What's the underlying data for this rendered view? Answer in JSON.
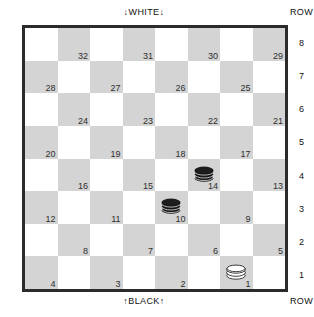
{
  "board": {
    "top_label": "↓WHITE↓",
    "bottom_label": "↑BLACK↑",
    "row_caption_top": "ROW",
    "row_caption_bottom": "ROW",
    "row_numbers": [
      "8",
      "7",
      "6",
      "5",
      "4",
      "3",
      "2",
      "1"
    ],
    "colors": {
      "light_square": "#ffffff",
      "dark_square": "#d4d4d4",
      "border": "#2b2b2b",
      "black_piece": "#1a1a1a",
      "white_piece": "#ffffff",
      "square_number_text": "#2e2e2e"
    },
    "squares": [
      {
        "row": 8,
        "col": 1,
        "shade": "light",
        "number": null,
        "piece": null
      },
      {
        "row": 8,
        "col": 2,
        "shade": "dark",
        "number": "32",
        "piece": null
      },
      {
        "row": 8,
        "col": 3,
        "shade": "light",
        "number": null,
        "piece": null
      },
      {
        "row": 8,
        "col": 4,
        "shade": "dark",
        "number": "31",
        "piece": null
      },
      {
        "row": 8,
        "col": 5,
        "shade": "light",
        "number": null,
        "piece": null
      },
      {
        "row": 8,
        "col": 6,
        "shade": "dark",
        "number": "30",
        "piece": null
      },
      {
        "row": 8,
        "col": 7,
        "shade": "light",
        "number": null,
        "piece": null
      },
      {
        "row": 8,
        "col": 8,
        "shade": "dark",
        "number": "29",
        "piece": null
      },
      {
        "row": 7,
        "col": 1,
        "shade": "dark",
        "number": "28",
        "piece": null
      },
      {
        "row": 7,
        "col": 2,
        "shade": "light",
        "number": null,
        "piece": null
      },
      {
        "row": 7,
        "col": 3,
        "shade": "dark",
        "number": "27",
        "piece": null
      },
      {
        "row": 7,
        "col": 4,
        "shade": "light",
        "number": null,
        "piece": null
      },
      {
        "row": 7,
        "col": 5,
        "shade": "dark",
        "number": "26",
        "piece": null
      },
      {
        "row": 7,
        "col": 6,
        "shade": "light",
        "number": null,
        "piece": null
      },
      {
        "row": 7,
        "col": 7,
        "shade": "dark",
        "number": "25",
        "piece": null
      },
      {
        "row": 7,
        "col": 8,
        "shade": "light",
        "number": null,
        "piece": null
      },
      {
        "row": 6,
        "col": 1,
        "shade": "light",
        "number": null,
        "piece": null
      },
      {
        "row": 6,
        "col": 2,
        "shade": "dark",
        "number": "24",
        "piece": null
      },
      {
        "row": 6,
        "col": 3,
        "shade": "light",
        "number": null,
        "piece": null
      },
      {
        "row": 6,
        "col": 4,
        "shade": "dark",
        "number": "23",
        "piece": null
      },
      {
        "row": 6,
        "col": 5,
        "shade": "light",
        "number": null,
        "piece": null
      },
      {
        "row": 6,
        "col": 6,
        "shade": "dark",
        "number": "22",
        "piece": null
      },
      {
        "row": 6,
        "col": 7,
        "shade": "light",
        "number": null,
        "piece": null
      },
      {
        "row": 6,
        "col": 8,
        "shade": "dark",
        "number": "21",
        "piece": null
      },
      {
        "row": 5,
        "col": 1,
        "shade": "dark",
        "number": "20",
        "piece": null
      },
      {
        "row": 5,
        "col": 2,
        "shade": "light",
        "number": null,
        "piece": null
      },
      {
        "row": 5,
        "col": 3,
        "shade": "dark",
        "number": "19",
        "piece": null
      },
      {
        "row": 5,
        "col": 4,
        "shade": "light",
        "number": null,
        "piece": null
      },
      {
        "row": 5,
        "col": 5,
        "shade": "dark",
        "number": "18",
        "piece": null
      },
      {
        "row": 5,
        "col": 6,
        "shade": "light",
        "number": null,
        "piece": null
      },
      {
        "row": 5,
        "col": 7,
        "shade": "dark",
        "number": "17",
        "piece": null
      },
      {
        "row": 5,
        "col": 8,
        "shade": "light",
        "number": null,
        "piece": null
      },
      {
        "row": 4,
        "col": 1,
        "shade": "light",
        "number": null,
        "piece": null
      },
      {
        "row": 4,
        "col": 2,
        "shade": "dark",
        "number": "16",
        "piece": null
      },
      {
        "row": 4,
        "col": 3,
        "shade": "light",
        "number": null,
        "piece": null
      },
      {
        "row": 4,
        "col": 4,
        "shade": "dark",
        "number": "15",
        "piece": null
      },
      {
        "row": 4,
        "col": 5,
        "shade": "light",
        "number": null,
        "piece": null
      },
      {
        "row": 4,
        "col": 6,
        "shade": "dark",
        "number": "14",
        "piece": "black-king"
      },
      {
        "row": 4,
        "col": 7,
        "shade": "light",
        "number": null,
        "piece": null
      },
      {
        "row": 4,
        "col": 8,
        "shade": "dark",
        "number": "13",
        "piece": null
      },
      {
        "row": 3,
        "col": 1,
        "shade": "dark",
        "number": "12",
        "piece": null
      },
      {
        "row": 3,
        "col": 2,
        "shade": "light",
        "number": null,
        "piece": null
      },
      {
        "row": 3,
        "col": 3,
        "shade": "dark",
        "number": "11",
        "piece": null
      },
      {
        "row": 3,
        "col": 4,
        "shade": "light",
        "number": null,
        "piece": null
      },
      {
        "row": 3,
        "col": 5,
        "shade": "dark",
        "number": "10",
        "piece": "black-king"
      },
      {
        "row": 3,
        "col": 6,
        "shade": "light",
        "number": null,
        "piece": null
      },
      {
        "row": 3,
        "col": 7,
        "shade": "dark",
        "number": "9",
        "piece": null
      },
      {
        "row": 3,
        "col": 8,
        "shade": "light",
        "number": null,
        "piece": null
      },
      {
        "row": 2,
        "col": 1,
        "shade": "light",
        "number": null,
        "piece": null
      },
      {
        "row": 2,
        "col": 2,
        "shade": "dark",
        "number": "8",
        "piece": null
      },
      {
        "row": 2,
        "col": 3,
        "shade": "light",
        "number": null,
        "piece": null
      },
      {
        "row": 2,
        "col": 4,
        "shade": "dark",
        "number": "7",
        "piece": null
      },
      {
        "row": 2,
        "col": 5,
        "shade": "light",
        "number": null,
        "piece": null
      },
      {
        "row": 2,
        "col": 6,
        "shade": "dark",
        "number": "6",
        "piece": null
      },
      {
        "row": 2,
        "col": 7,
        "shade": "light",
        "number": null,
        "piece": null
      },
      {
        "row": 2,
        "col": 8,
        "shade": "dark",
        "number": "5",
        "piece": null
      },
      {
        "row": 1,
        "col": 1,
        "shade": "dark",
        "number": "4",
        "piece": null
      },
      {
        "row": 1,
        "col": 2,
        "shade": "light",
        "number": null,
        "piece": null
      },
      {
        "row": 1,
        "col": 3,
        "shade": "dark",
        "number": "3",
        "piece": null
      },
      {
        "row": 1,
        "col": 4,
        "shade": "light",
        "number": null,
        "piece": null
      },
      {
        "row": 1,
        "col": 5,
        "shade": "dark",
        "number": "2",
        "piece": null
      },
      {
        "row": 1,
        "col": 6,
        "shade": "light",
        "number": null,
        "piece": null
      },
      {
        "row": 1,
        "col": 7,
        "shade": "dark",
        "number": "1",
        "piece": "white-king"
      },
      {
        "row": 1,
        "col": 8,
        "shade": "light",
        "number": null,
        "piece": null
      }
    ]
  }
}
